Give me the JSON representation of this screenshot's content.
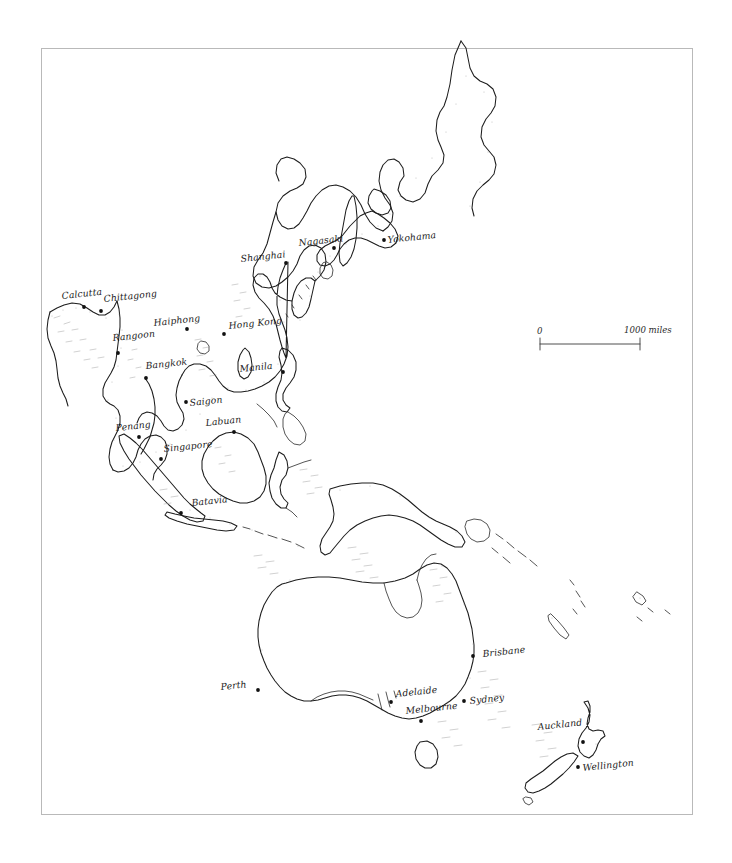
{
  "map": {
    "title": "Asia-Pacific Region Outline Map",
    "style": "hand-drawn pen and ink outline map",
    "background_color": "#ffffff",
    "ink_color": "#1d1d1d",
    "frame": {
      "color": "#b9b9b9",
      "x": 41,
      "y": 48,
      "width": 652,
      "height": 767
    },
    "scale_bar": {
      "start_label": "0",
      "end_label": "1000 miles",
      "x": 540,
      "y": 344,
      "length": 100
    },
    "cities": [
      {
        "name": "Calcutta",
        "label_x": 62,
        "label_y": 299,
        "dot_x": 84,
        "dot_y": 307
      },
      {
        "name": "Chittagong",
        "label_x": 104,
        "label_y": 302,
        "dot_x": 101,
        "dot_y": 311
      },
      {
        "name": "Rangoon",
        "label_x": 113,
        "label_y": 341,
        "dot_x": 118,
        "dot_y": 353
      },
      {
        "name": "Bangkok",
        "label_x": 146,
        "label_y": 369,
        "dot_x": 146,
        "dot_y": 378
      },
      {
        "name": "Haiphong",
        "label_x": 154,
        "label_y": 326,
        "dot_x": 187,
        "dot_y": 329
      },
      {
        "name": "Hong Kong",
        "label_x": 229,
        "label_y": 329,
        "dot_x": 224,
        "dot_y": 334
      },
      {
        "name": "Saigon",
        "label_x": 190,
        "label_y": 406,
        "dot_x": 186,
        "dot_y": 402
      },
      {
        "name": "Penang",
        "label_x": 116,
        "label_y": 431,
        "dot_x": 139,
        "dot_y": 437
      },
      {
        "name": "Singapore",
        "label_x": 164,
        "label_y": 452,
        "dot_x": 161,
        "dot_y": 459
      },
      {
        "name": "Labuan",
        "label_x": 206,
        "label_y": 426,
        "dot_x": 234,
        "dot_y": 432
      },
      {
        "name": "Batavia",
        "label_x": 192,
        "label_y": 506,
        "dot_x": 181,
        "dot_y": 513
      },
      {
        "name": "Manila",
        "label_x": 240,
        "label_y": 372,
        "dot_x": 283,
        "dot_y": 372
      },
      {
        "name": "Shanghai",
        "label_x": 241,
        "label_y": 262,
        "dot_x": 286,
        "dot_y": 263
      },
      {
        "name": "Nagasaki",
        "label_x": 299,
        "label_y": 246,
        "dot_x": 334,
        "dot_y": 248
      },
      {
        "name": "Yokohama",
        "label_x": 388,
        "label_y": 243,
        "dot_x": 384,
        "dot_y": 240
      },
      {
        "name": "Perth",
        "label_x": 221,
        "label_y": 690,
        "dot_x": 258,
        "dot_y": 690
      },
      {
        "name": "Adelaide",
        "label_x": 396,
        "label_y": 697,
        "dot_x": 391,
        "dot_y": 702
      },
      {
        "name": "Melbourne",
        "label_x": 406,
        "label_y": 714,
        "dot_x": 421,
        "dot_y": 721
      },
      {
        "name": "Sydney",
        "label_x": 470,
        "label_y": 704,
        "dot_x": 464,
        "dot_y": 701
      },
      {
        "name": "Brisbane",
        "label_x": 483,
        "label_y": 657,
        "dot_x": 473,
        "dot_y": 656
      },
      {
        "name": "Auckland",
        "label_x": 538,
        "label_y": 730,
        "dot_x": 583,
        "dot_y": 742
      },
      {
        "name": "Wellington",
        "label_x": 583,
        "label_y": 771,
        "dot_x": 578,
        "dot_y": 767
      }
    ],
    "regions_depicted": [
      "Kamchatka Peninsula",
      "Sea of Okhotsk",
      "Sakhalin",
      "Japan",
      "Korea",
      "China coast",
      "Taiwan",
      "Indochina",
      "Bay of Bengal",
      "Malay Peninsula",
      "Sumatra",
      "Java",
      "Borneo",
      "Sulawesi",
      "Philippines",
      "New Guinea",
      "Solomon Islands",
      "New Caledonia",
      "Fiji",
      "Australia",
      "Tasmania",
      "New Zealand"
    ]
  }
}
